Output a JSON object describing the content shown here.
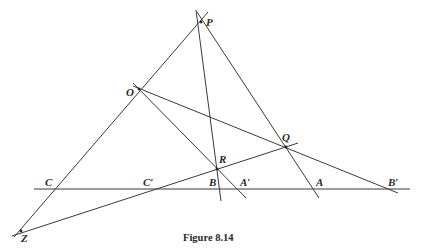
{
  "figure": {
    "caption": "Figure 8.14",
    "stroke_color": "#3a3a3a",
    "background": "#ffffff"
  },
  "points": {
    "P": {
      "label": "P",
      "x": 201,
      "y": 22
    },
    "O": {
      "label": "O",
      "x": 139,
      "y": 89
    },
    "Q": {
      "label": "Q",
      "x": 286,
      "y": 147
    },
    "R": {
      "label": "R",
      "x": 217,
      "y": 169
    },
    "C": {
      "label": "C",
      "x": 57,
      "y": 189
    },
    "C_prime": {
      "label": "C′",
      "x": 147,
      "y": 189
    },
    "B": {
      "label": "B",
      "x": 214,
      "y": 189
    },
    "A_prime": {
      "label": "A′",
      "x": 238,
      "y": 189
    },
    "A": {
      "label": "A",
      "x": 313,
      "y": 189
    },
    "B_prime": {
      "label": "B′",
      "x": 390,
      "y": 189
    },
    "Z": {
      "label": "Z",
      "x": 21,
      "y": 231
    }
  },
  "lines": [
    {
      "name": "baseline",
      "from": [
        34,
        189
      ],
      "to": [
        410,
        189
      ]
    },
    {
      "name": "line-ZP",
      "from": [
        14,
        237
      ],
      "to": [
        208,
        12
      ]
    },
    {
      "name": "line-PB",
      "from": [
        196,
        10
      ],
      "to": [
        221,
        201
      ]
    },
    {
      "name": "line-PA",
      "from": [
        197,
        12
      ],
      "to": [
        319,
        198
      ]
    },
    {
      "name": "line-OA-prime",
      "from": [
        133,
        83
      ],
      "to": [
        246,
        198
      ]
    },
    {
      "name": "line-OB-prime",
      "from": [
        133,
        86
      ],
      "to": [
        398,
        193
      ]
    },
    {
      "name": "line-ZQ",
      "from": [
        12,
        236
      ],
      "to": [
        298,
        143
      ]
    }
  ]
}
